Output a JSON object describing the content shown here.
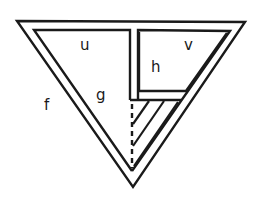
{
  "diagram": {
    "type": "nested-triangle-region-diagram",
    "stroke_color": "#1a1a1a",
    "background": "#ffffff",
    "labels": {
      "f": "f",
      "u": "u",
      "v": "v",
      "h": "h",
      "g": "g"
    },
    "regions": [
      {
        "id": "f",
        "description": "outer triangular band"
      },
      {
        "id": "u",
        "description": "large left region"
      },
      {
        "id": "v",
        "description": "upper-right region"
      },
      {
        "id": "h",
        "description": "inner box inside v area"
      },
      {
        "id": "g",
        "description": "lower-left region with dashed divider"
      },
      {
        "id": "hatched",
        "description": "hatched strip near bottom right"
      }
    ]
  }
}
